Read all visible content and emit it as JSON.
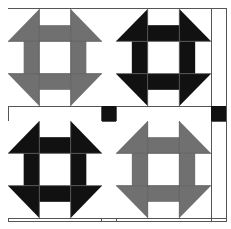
{
  "colors": {
    "background": "#ffffff",
    "gray": "#707070",
    "black": "#111111",
    "line": "#555555"
  },
  "layout": {
    "rows": 2,
    "cols": 2,
    "sashing": "white with black cornerstones"
  },
  "blocks": [
    {
      "position": "top-left",
      "pattern": "churn-dash",
      "color": "#707070"
    },
    {
      "position": "top-right",
      "pattern": "churn-dash",
      "color": "#111111"
    },
    {
      "position": "bottom-left",
      "pattern": "churn-dash",
      "color": "#111111"
    },
    {
      "position": "bottom-right",
      "pattern": "churn-dash",
      "color": "#707070"
    }
  ],
  "cornerstones": [
    {
      "position": "center",
      "color": "#111111"
    },
    {
      "position": "right-middle",
      "color": "#111111"
    }
  ]
}
